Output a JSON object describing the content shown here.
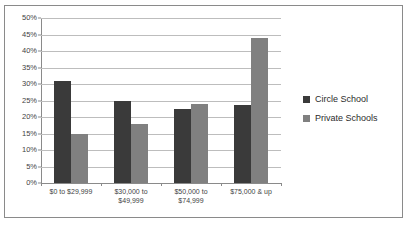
{
  "chart_data": {
    "type": "bar",
    "title": "",
    "xlabel": "",
    "ylabel": "",
    "ylim": [
      0,
      50
    ],
    "ytick_step": 5,
    "grid": true,
    "legend_position": "right",
    "categories": [
      "$0 to $29,999",
      "$30,000 to $49,999",
      "$50,000 to $74,999",
      "$75,000 & up"
    ],
    "category_lines": [
      [
        "$0 to $29,999"
      ],
      [
        "$30,000 to",
        "$49,999"
      ],
      [
        "$50,000 to",
        "$74,999"
      ],
      [
        "$75,000 & up"
      ]
    ],
    "ytick_labels": [
      "0%",
      "5%",
      "10%",
      "15%",
      "20%",
      "25%",
      "30%",
      "35%",
      "40%",
      "45%",
      "50%"
    ],
    "series": [
      {
        "name": "Circle School",
        "color": "#3a3a3a",
        "values": [
          31,
          25,
          22.5,
          23.5
        ]
      },
      {
        "name": "Private Schools",
        "color": "#808080",
        "values": [
          15,
          18,
          24,
          44
        ]
      }
    ]
  },
  "frame": {
    "border_color": "#8a8a8a",
    "background": "#ffffff"
  }
}
